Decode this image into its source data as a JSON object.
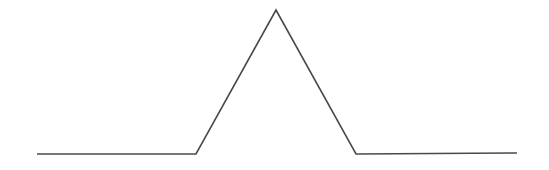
{
  "diagram": {
    "type": "triangular-pulse",
    "stroke_color": "#4a4a4a",
    "background": "#ffffff",
    "stroke_width": 1.6,
    "points": [
      {
        "x": 37,
        "y": 154
      },
      {
        "x": 196,
        "y": 154
      },
      {
        "x": 276,
        "y": 10
      },
      {
        "x": 356,
        "y": 154
      },
      {
        "x": 517,
        "y": 153
      }
    ]
  }
}
